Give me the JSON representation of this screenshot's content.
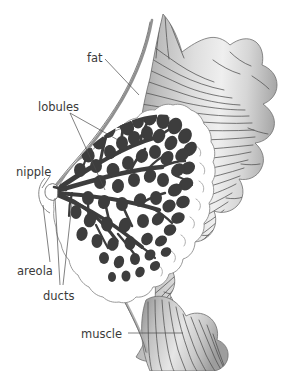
{
  "figure": {
    "background_color": "#ffffff"
  },
  "labels": {
    "fat": "fat",
    "lobules": "lobules",
    "nipple": "nipple",
    "areola": "areola",
    "ducts": "ducts",
    "muscle": "muscle"
  },
  "colors": {
    "lobule_fill": "#3d3d3d",
    "duct_stroke": "#3d3d3d",
    "skin_outline": "#6e6e6e",
    "muscle_light": "#f2f2f2",
    "muscle_mid": "#c8c8c8",
    "muscle_dark": "#8d8d8d",
    "fiber_line": "#4d4d4d",
    "fat_fill": "#ffffff",
    "fat_outline": "#8a8a8a",
    "label_text": "#3a3a3a",
    "leader_line": "#4a4a4a"
  },
  "structures": [
    {
      "name": "fat",
      "label": "fat",
      "description": "subcutaneous fatty tissue, scalloped white region"
    },
    {
      "name": "lobules",
      "label": "lobules",
      "description": "dark milk-producing glandular clusters"
    },
    {
      "name": "nipple",
      "label": "nipple",
      "description": "apex where ducts converge"
    },
    {
      "name": "areola",
      "label": "areola",
      "description": "pigmented skin surrounding nipple"
    },
    {
      "name": "ducts",
      "label": "ducts",
      "description": "branching milk ducts radiating from nipple"
    },
    {
      "name": "muscle",
      "label": "muscle",
      "description": "chest wall muscle with striated fibers"
    }
  ]
}
